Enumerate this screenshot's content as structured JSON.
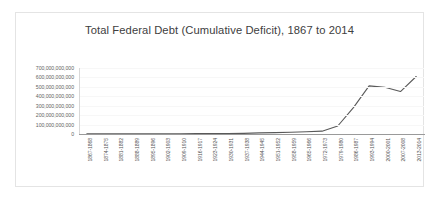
{
  "chart_data": {
    "type": "line",
    "title": "Total Federal Debt (Cumulative Deficit), 1867 to 2014",
    "xlabel": "",
    "ylabel": "",
    "grid": true,
    "legend": false,
    "ylim": [
      0,
      700000000000
    ],
    "ytick_values": [
      0,
      100000000000,
      200000000000,
      300000000000,
      400000000000,
      500000000000,
      600000000000,
      700000000000
    ],
    "ytick_labels": [
      "0",
      "100,000,000,000",
      "200,000,000,000",
      "300,000,000,000",
      "400,000,000,000",
      "500,000,000,000",
      "600,000,000,000",
      "700,000,000,000"
    ],
    "categories": [
      "1867-1868",
      "1874-1875",
      "1881-1882",
      "1888-1889",
      "1895-1896",
      "1902-1903",
      "1909-1910",
      "1916-1917",
      "1923-1924",
      "1930-1931",
      "1937-1938",
      "1944-1945",
      "1951-1952",
      "1958-1959",
      "1965-1966",
      "1972-1973",
      "1979-1980",
      "1986-1987",
      "1993-1994",
      "2000-2001",
      "2007-2008",
      "2013-2014"
    ],
    "series": [
      {
        "name": "Total Federal Debt",
        "color": "#595959",
        "values": [
          2500000000,
          2200000000,
          1800000000,
          1500000000,
          1700000000,
          2000000000,
          2200000000,
          3500000000,
          5000000000,
          5500000000,
          7000000000,
          12000000000,
          15000000000,
          18000000000,
          24000000000,
          30000000000,
          85000000000,
          280000000000,
          510000000000,
          495000000000,
          450000000000,
          610000000000
        ]
      }
    ]
  }
}
